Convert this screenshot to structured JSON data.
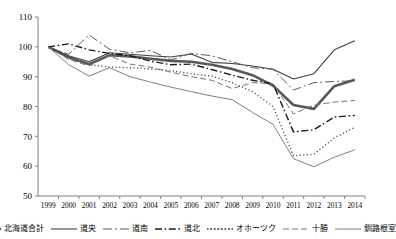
{
  "chart_data": {
    "type": "line",
    "title": "",
    "xlabel": "",
    "ylabel": "",
    "ylim": [
      50,
      110
    ],
    "yticks": [
      50,
      60,
      70,
      80,
      90,
      100,
      110
    ],
    "grid": false,
    "legend_position": "bottom",
    "categories": [
      "1999",
      "2000",
      "2001",
      "2002",
      "2003",
      "2004",
      "2005",
      "2006",
      "2007",
      "2008",
      "2009",
      "2010",
      "2011",
      "2012",
      "2013",
      "2014"
    ],
    "series": [
      {
        "name": "北海道合計",
        "style": "solid-thick",
        "color": "#595959",
        "width": 2.6,
        "values": [
          100,
          96.5,
          94.2,
          97.2,
          96.8,
          96.0,
          95.3,
          95.0,
          94.0,
          92.6,
          90.5,
          87.0,
          80.5,
          79.2,
          86.8,
          89.0
        ]
      },
      {
        "name": "道央",
        "style": "solid-thin",
        "color": "#404040",
        "width": 1.1,
        "values": [
          100,
          97.0,
          95.0,
          98.0,
          97.5,
          97.0,
          96.6,
          97.6,
          94.8,
          94.4,
          93.6,
          92.5,
          89.2,
          91.0,
          99.0,
          102.0
        ]
      },
      {
        "name": "道南",
        "style": "dash-dot-long",
        "color": "#595959",
        "width": 1.0,
        "values": [
          100,
          97.5,
          104.0,
          99.2,
          98.0,
          98.8,
          95.6,
          97.8,
          97.0,
          95.0,
          93.0,
          92.5,
          85.5,
          88.0,
          88.4,
          88.6
        ]
      },
      {
        "name": "道北",
        "style": "dash-dot-short",
        "color": "#1a1a1a",
        "width": 1.4,
        "values": [
          100,
          101.0,
          99.0,
          97.8,
          97.0,
          95.2,
          94.0,
          94.2,
          92.4,
          90.5,
          88.8,
          87.6,
          71.5,
          72.2,
          76.5,
          77.0
        ]
      },
      {
        "name": "オホーツク",
        "style": "dotted",
        "color": "#404040",
        "width": 1.3,
        "values": [
          100,
          96.2,
          94.0,
          93.2,
          93.0,
          92.6,
          92.0,
          91.0,
          90.2,
          88.0,
          85.0,
          80.0,
          63.5,
          64.0,
          69.5,
          73.0
        ]
      },
      {
        "name": "十勝",
        "style": "dashed",
        "color": "#737373",
        "width": 1.0,
        "values": [
          100,
          95.8,
          93.6,
          97.0,
          94.2,
          93.2,
          91.5,
          90.0,
          88.8,
          86.0,
          88.0,
          87.6,
          77.5,
          80.5,
          81.5,
          82.0
        ]
      },
      {
        "name": "釧路根室",
        "style": "solid-thin",
        "color": "#808080",
        "width": 1.0,
        "values": [
          100,
          94.0,
          90.2,
          93.0,
          90.0,
          88.2,
          86.5,
          85.0,
          83.5,
          82.3,
          78.0,
          74.0,
          62.5,
          59.8,
          63.0,
          65.5
        ]
      }
    ]
  }
}
